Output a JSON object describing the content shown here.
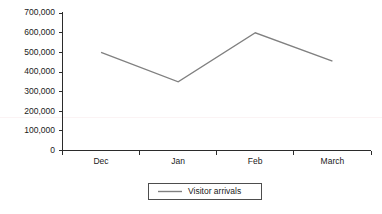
{
  "chart_data": {
    "type": "line",
    "title": "",
    "subtitle": "",
    "xlabel": "",
    "ylabel": "",
    "categories": [
      "Dec",
      "Jan",
      "Feb",
      "March"
    ],
    "series": [
      {
        "name": "Visitor arrivals",
        "values": [
          500000,
          350000,
          600000,
          455000
        ],
        "color": "#808080"
      }
    ],
    "ylim": [
      0,
      700000
    ],
    "ytick_labels": [
      "0",
      "100,000",
      "200,000",
      "300,000",
      "400,000",
      "500,000",
      "600,000",
      "700,000"
    ],
    "ytick_values": [
      0,
      100000,
      200000,
      300000,
      400000,
      500000,
      600000,
      700000
    ],
    "grid": false,
    "legend": {
      "position": "bottom",
      "entries": [
        "Visitor arrivals"
      ]
    },
    "axis_color": "#2b2b2b",
    "background": "#ffffff"
  },
  "legend": {
    "entry_0": "Visitor arrivals"
  },
  "axis": {
    "y_labels": {
      "t0": "0",
      "t1": "100,000",
      "t2": "200,000",
      "t3": "300,000",
      "t4": "400,000",
      "t5": "500,000",
      "t6": "600,000",
      "t7": "700,000"
    },
    "x_labels": {
      "c0": "Dec",
      "c1": "Jan",
      "c2": "Feb",
      "c3": "March"
    }
  }
}
